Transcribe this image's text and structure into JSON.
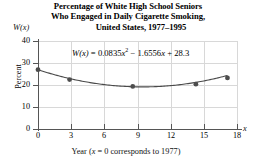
{
  "chart_data": {
    "type": "scatter",
    "title": "Percentage of White High School Seniors Who Engaged in Daily Cigarette Smoking, United States, 1977–1995",
    "title_lines": [
      "Percentage of White High School Seniors",
      "Who Engaged in Daily Cigarette Smoking,",
      "United States, 1977–1995"
    ],
    "xlabel": "Year (x = 0 corresponds to 1977)",
    "xlabel_prefix": "Year (",
    "xlabel_var": "x",
    "xlabel_suffix": " = 0 corresponds to 1977)",
    "ylabel": "Percent",
    "y_axis_var": "W(x)",
    "x_axis_var": "x",
    "xlim": [
      0,
      19
    ],
    "ylim": [
      0,
      42
    ],
    "xticks": [
      0,
      3,
      6,
      9,
      12,
      15,
      18
    ],
    "yticks": [
      0,
      10,
      20,
      30,
      40
    ],
    "grid": true,
    "legend": "none",
    "annotation": "W(x) = 0.0835x² − 1.6556x + 28.3",
    "equation": {
      "lhs": "W(x)",
      "eq": "=",
      "a": "0.0835",
      "a_var": "x",
      "a_exp": "2",
      "b_sign": "−",
      "b": "1.6556",
      "b_var": "x",
      "c_sign": "+",
      "c": "28.3"
    },
    "x": [
      0,
      3,
      9,
      15,
      18
    ],
    "values": [
      28.3,
      23.6,
      20.3,
      21.4,
      24.4
    ],
    "points": [
      {
        "x": 0,
        "y": 28.3,
        "year": 1977
      },
      {
        "x": 3,
        "y": 23.6,
        "year": 1980
      },
      {
        "x": 9,
        "y": 20.3,
        "year": 1986
      },
      {
        "x": 15,
        "y": 21.4,
        "year": 1992
      },
      {
        "x": 18,
        "y": 24.4,
        "year": 1995
      }
    ],
    "curve": {
      "label": "W(x) = 0.0835x^2 - 1.6556x + 28.3",
      "a": 0.0835,
      "b": -1.6556,
      "c": 28.3
    },
    "colors": {
      "point": "#4d4d4d",
      "curve": "#4a4a4a",
      "axis": "#555555",
      "grid": "#d8d8d8",
      "background": "#ffffff",
      "text": "#000000"
    }
  }
}
